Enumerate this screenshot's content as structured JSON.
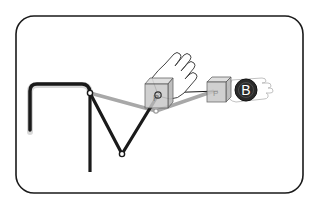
{
  "diagram": {
    "frame": {
      "x": 16,
      "y": 16,
      "width": 287,
      "height": 177,
      "radius": 18,
      "stroke": "#1a1a1a"
    },
    "colors": {
      "arm_black": "#1a1a1a",
      "arm_grey": "#a8a8a8",
      "cube_fill": "#c8c8c8",
      "cube_stroke": "#555555",
      "ball_fill": "#2a2a2a",
      "ghost_hand": "#bbbbbb"
    },
    "elements": {
      "base_post_label": "base",
      "joint_1_label": "shoulder joint",
      "joint_2_label": "elbow joint",
      "cube_a_label": "P",
      "cube_b_label": "P",
      "ball_label": "B",
      "hand_label": "hand",
      "ghost_hand_label": "ghost hand"
    }
  }
}
